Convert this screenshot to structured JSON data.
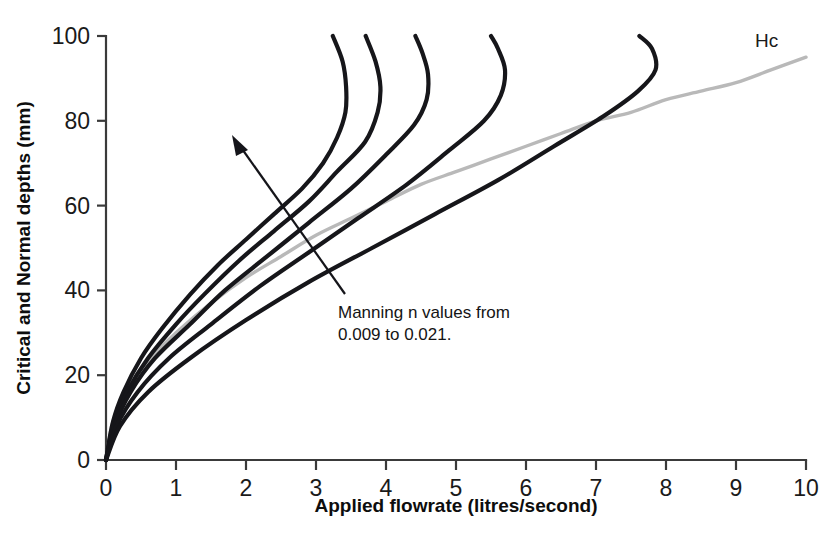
{
  "chart_data": {
    "type": "line",
    "title": "",
    "xlabel": "Applied flowrate (litres/second)",
    "ylabel": "Critical and Normal depths (mm)",
    "xlim": [
      0,
      10
    ],
    "ylim": [
      0,
      100
    ],
    "xticks": [
      "0",
      "1",
      "2",
      "3",
      "4",
      "5",
      "6",
      "7",
      "8",
      "9",
      "10"
    ],
    "yticks": [
      "0",
      "20",
      "40",
      "60",
      "80",
      "100"
    ],
    "grid": false,
    "legend_position": "inline-label",
    "annotations": [
      {
        "name": "manning-range-note",
        "line1": "Manning n values from",
        "line2": "0.009 to 0.021.",
        "arrow_from": [
          4.0,
          39
        ],
        "arrow_to": [
          1.87,
          74
        ]
      }
    ],
    "series": [
      {
        "name": "Hc",
        "label": "Hc",
        "color": "#b9b9b9",
        "kind": "critical-depth",
        "points": [
          [
            0,
            0
          ],
          [
            0.08,
            8
          ],
          [
            0.2,
            13
          ],
          [
            0.4,
            19
          ],
          [
            0.7,
            25
          ],
          [
            1.0,
            30
          ],
          [
            1.5,
            37
          ],
          [
            2.0,
            43
          ],
          [
            2.5,
            48
          ],
          [
            3.0,
            53
          ],
          [
            3.5,
            57
          ],
          [
            4.0,
            61
          ],
          [
            4.5,
            65
          ],
          [
            5.0,
            68
          ],
          [
            5.5,
            71
          ],
          [
            6.0,
            74
          ],
          [
            6.5,
            77
          ],
          [
            7.0,
            80
          ],
          [
            7.5,
            82
          ],
          [
            8.0,
            85
          ],
          [
            8.5,
            87
          ],
          [
            9.0,
            89
          ],
          [
            9.5,
            92
          ],
          [
            10.0,
            95
          ]
        ]
      },
      {
        "name": "n-0.009",
        "label": "n = 0.009",
        "color": "#16161a",
        "kind": "normal-depth",
        "points": [
          [
            0,
            0
          ],
          [
            0.1,
            9
          ],
          [
            0.25,
            16
          ],
          [
            0.5,
            24
          ],
          [
            0.8,
            31
          ],
          [
            1.2,
            39
          ],
          [
            1.6,
            46
          ],
          [
            2.0,
            52
          ],
          [
            2.4,
            58
          ],
          [
            2.8,
            64
          ],
          [
            3.1,
            70
          ],
          [
            3.3,
            76
          ],
          [
            3.42,
            82
          ],
          [
            3.43,
            88
          ],
          [
            3.38,
            94
          ],
          [
            3.24,
            100
          ]
        ]
      },
      {
        "name": "n-0.012",
        "label": "n = 0.012",
        "color": "#16161a",
        "kind": "normal-depth",
        "points": [
          [
            0,
            0
          ],
          [
            0.1,
            8
          ],
          [
            0.3,
            16
          ],
          [
            0.6,
            24
          ],
          [
            1.0,
            32
          ],
          [
            1.4,
            39
          ],
          [
            1.9,
            47
          ],
          [
            2.4,
            54
          ],
          [
            2.9,
            61
          ],
          [
            3.3,
            68
          ],
          [
            3.7,
            75
          ],
          [
            3.88,
            82
          ],
          [
            3.92,
            88
          ],
          [
            3.85,
            94
          ],
          [
            3.71,
            100
          ]
        ]
      },
      {
        "name": "n-0.015",
        "label": "n = 0.015",
        "color": "#16161a",
        "kind": "normal-depth",
        "points": [
          [
            0,
            0
          ],
          [
            0.12,
            8
          ],
          [
            0.35,
            16
          ],
          [
            0.7,
            24
          ],
          [
            1.2,
            32
          ],
          [
            1.7,
            40
          ],
          [
            2.3,
            48
          ],
          [
            2.9,
            56
          ],
          [
            3.5,
            64
          ],
          [
            4.0,
            72
          ],
          [
            4.4,
            79
          ],
          [
            4.58,
            85
          ],
          [
            4.6,
            91
          ],
          [
            4.52,
            96
          ],
          [
            4.42,
            100
          ]
        ]
      },
      {
        "name": "n-0.018",
        "label": "n = 0.018",
        "color": "#16161a",
        "kind": "normal-depth",
        "points": [
          [
            0,
            0
          ],
          [
            0.15,
            8
          ],
          [
            0.45,
            16
          ],
          [
            0.9,
            24
          ],
          [
            1.5,
            32
          ],
          [
            2.2,
            41
          ],
          [
            2.9,
            49
          ],
          [
            3.6,
            57
          ],
          [
            4.3,
            65
          ],
          [
            4.9,
            73
          ],
          [
            5.4,
            80
          ],
          [
            5.64,
            86
          ],
          [
            5.7,
            92
          ],
          [
            5.6,
            97
          ],
          [
            5.5,
            100
          ]
        ]
      },
      {
        "name": "n-0.021",
        "label": "n = 0.021",
        "color": "#16161a",
        "kind": "normal-depth",
        "points": [
          [
            0,
            0
          ],
          [
            0.2,
            8
          ],
          [
            0.6,
            16
          ],
          [
            1.2,
            24
          ],
          [
            2.0,
            33
          ],
          [
            2.9,
            42
          ],
          [
            3.8,
            50
          ],
          [
            4.7,
            58
          ],
          [
            5.6,
            66
          ],
          [
            6.4,
            74
          ],
          [
            7.1,
            81
          ],
          [
            7.6,
            87
          ],
          [
            7.85,
            92
          ],
          [
            7.8,
            97
          ],
          [
            7.62,
            100
          ]
        ]
      }
    ]
  },
  "labels": {
    "hc_series_label": "Hc"
  }
}
